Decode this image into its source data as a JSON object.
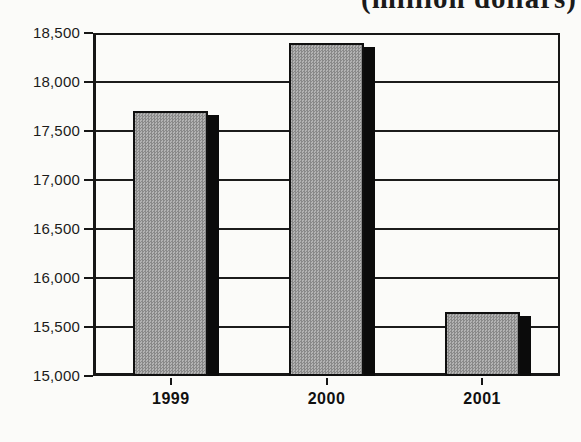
{
  "chart_data": {
    "type": "bar",
    "title": "(million dollars)",
    "categories": [
      "1999",
      "2000",
      "2001"
    ],
    "values": [
      17700,
      18400,
      15650
    ],
    "xlabel": "",
    "ylabel": "",
    "ylim": [
      15000,
      18500
    ],
    "ytick_step": 500,
    "ytick_labels": [
      "18,500",
      "18,000",
      "17,500",
      "17,000",
      "16,500",
      "16,000",
      "15,500",
      "15,000"
    ],
    "grid": true,
    "legend": false,
    "bar_fill_color": "#9e9e9e",
    "bar_border_color": "#0f0f0f",
    "bar_shadow_color": "#0b0b0b",
    "axis_color": "#161616",
    "background_color": "#fbfbf9"
  }
}
